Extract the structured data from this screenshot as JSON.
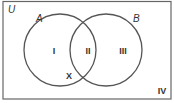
{
  "diagram": {
    "type": "venn",
    "universe_label": "U",
    "sets": [
      {
        "label": "A"
      },
      {
        "label": "B"
      }
    ],
    "regions": {
      "only_a": "I",
      "a_and_b": "II",
      "only_b": "III",
      "outside": "IV"
    },
    "marker": "X",
    "colors": {
      "stroke": "#555555",
      "text": "#333333",
      "background": "#ffffff"
    }
  }
}
